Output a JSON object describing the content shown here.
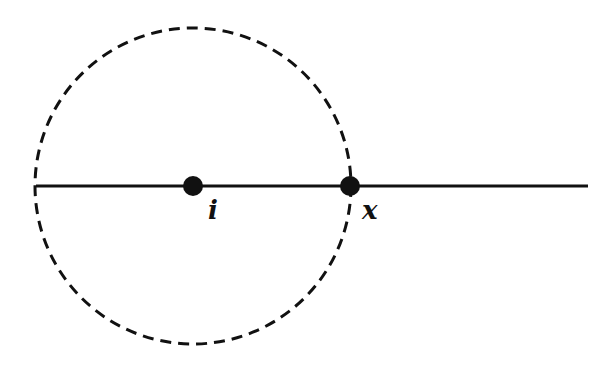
{
  "figure": {
    "background": "#ffffff",
    "ink_color": "#111111",
    "circle": {
      "center": [
        193,
        186
      ],
      "radius": 158,
      "style": "dashed",
      "dash": [
        11,
        7
      ],
      "stroke_width": 3
    },
    "line": {
      "x1": 36,
      "x2": 588,
      "y": 186,
      "stroke_width": 3
    },
    "points": [
      {
        "name": "i",
        "label": "i",
        "cx": 193,
        "cy": 186,
        "r": 10,
        "label_x": 208,
        "label_y": 219
      },
      {
        "name": "x",
        "label": "x",
        "cx": 350,
        "cy": 186,
        "r": 10,
        "label_x": 362,
        "label_y": 219
      }
    ]
  }
}
